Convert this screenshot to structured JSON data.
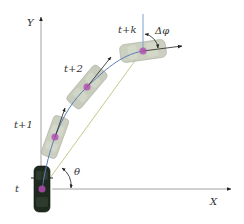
{
  "diagram": {
    "type": "vehicle-trajectory",
    "axes": {
      "x_label": "X",
      "y_label": "Y"
    },
    "vehicles": [
      {
        "label": "t",
        "cx": 42,
        "cy": 189,
        "angle": 0,
        "style": "dark"
      },
      {
        "label": "t+1",
        "cx": 55,
        "cy": 137,
        "angle": 20,
        "style": "ghost"
      },
      {
        "label": "t+2",
        "cx": 87,
        "cy": 87,
        "angle": 40,
        "style": "ghost"
      },
      {
        "label": "t+k",
        "cx": 143,
        "cy": 51,
        "angle": 82,
        "style": "ghost"
      }
    ],
    "annotations": {
      "theta": "θ",
      "delta_phi": "Δφ"
    },
    "colors": {
      "path": "#5a7fb8",
      "chord": "#c8c98a",
      "axis": "#6a6a6a",
      "center_marker": "#b04bb0",
      "vehicle_dark": "#1f2a1f",
      "vehicle_ghost": "#b9bfae"
    }
  }
}
